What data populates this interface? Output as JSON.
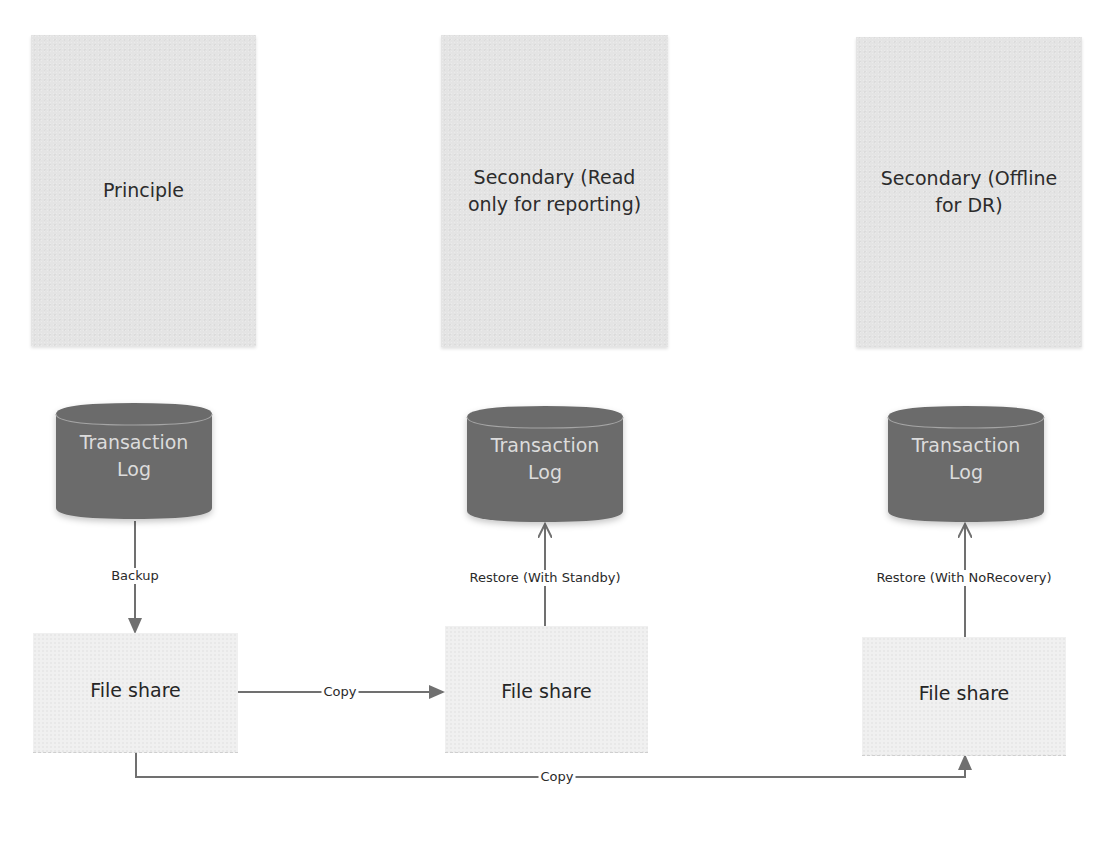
{
  "diagram": {
    "colors": {
      "server_box": "#e4e4e4",
      "cylinder": "#6b6b6b",
      "cylinder_text": "#dcdcdc",
      "fileshare": "#f0f0f0",
      "arrow": "#707070"
    },
    "columns": [
      {
        "server": {
          "label": "Principle"
        },
        "log": {
          "line1": "Transaction",
          "line2": "Log"
        },
        "fileshare": {
          "label": "File share"
        },
        "log_edge": {
          "label": "Backup",
          "direction": "down"
        }
      },
      {
        "server": {
          "label": "Secondary (Read only for reporting)"
        },
        "log": {
          "line1": "Transaction",
          "line2": "Log"
        },
        "fileshare": {
          "label": "File share"
        },
        "log_edge": {
          "label": "Restore (With Standby)",
          "direction": "up"
        }
      },
      {
        "server": {
          "label": "Secondary (Offline for DR)"
        },
        "log": {
          "line1": "Transaction",
          "line2": "Log"
        },
        "fileshare": {
          "label": "File share"
        },
        "log_edge": {
          "label": "Restore (With NoRecovery)",
          "direction": "up"
        }
      }
    ],
    "copy_edges": [
      {
        "label": "Copy",
        "from": "File share (Principle)",
        "to": "File share (Secondary Read only)"
      },
      {
        "label": "Copy",
        "from": "File share (Principle)",
        "to": "File share (Secondary Offline)"
      }
    ]
  }
}
